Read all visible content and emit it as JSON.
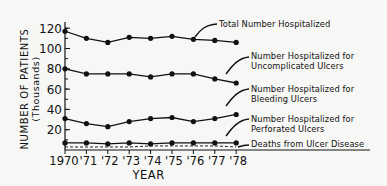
{
  "chart_data": {
    "type": "line",
    "title": "",
    "xlabel": "YEAR",
    "ylabel": "NUMBER OF PATIENTS",
    "ylabel_sub": "(Thousands)",
    "x": [
      "1970",
      "'71",
      "'72",
      "'73",
      "'74",
      "'75",
      "'76",
      "'77",
      "'78"
    ],
    "yticks": [
      20,
      40,
      60,
      80,
      100,
      120
    ],
    "ylim": [
      0,
      130
    ],
    "grid": false,
    "legend_position": "inline-right-annotations",
    "series": [
      {
        "name": "Total Number Hospitalized",
        "style": "solid-markers",
        "values": [
          117,
          110,
          106,
          111,
          110,
          112,
          109,
          108,
          106
        ]
      },
      {
        "name": "Number Hospitalized for Uncomplicated Ulcers",
        "style": "solid-markers",
        "values": [
          80,
          75,
          75,
          75,
          72,
          75,
          75,
          70,
          66
        ]
      },
      {
        "name": "Number Hospitalized for Bleeding Ulcers",
        "style": "solid-markers",
        "values": [
          31,
          26,
          23,
          28,
          31,
          32,
          28,
          31,
          35
        ]
      },
      {
        "name": "Number Hospitalized for Perforated Ulcers",
        "style": "solid-markers",
        "values": [
          7,
          7,
          6,
          7,
          6,
          7,
          7,
          7,
          7
        ]
      },
      {
        "name": "Deaths from Ulcer Disease",
        "style": "dashed",
        "values": [
          3,
          3,
          3,
          3,
          4,
          4,
          4,
          4,
          3
        ]
      }
    ]
  },
  "labels": {
    "total": [
      "Total Number Hospitalized"
    ],
    "uncomplicated": [
      "Number Hospitalized for",
      "Uncomplicated Ulcers"
    ],
    "bleeding": [
      "Number Hospitalized for",
      "Bleeding Ulcers"
    ],
    "perforated": [
      "Number Hospitalized for",
      "Perforated Ulcers"
    ],
    "deaths": [
      "Deaths from Ulcer Disease"
    ]
  },
  "axis": {
    "ylabel": "NUMBER OF PATIENTS",
    "ylabel_sub": "(Thousands)",
    "xlabel": "YEAR"
  }
}
